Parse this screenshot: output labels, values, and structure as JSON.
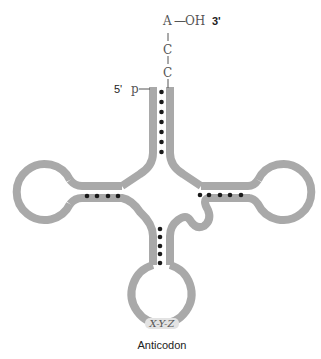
{
  "diagram": {
    "labels": {
      "three_prime_base": "A",
      "three_prime_dash": "—",
      "three_prime_group": "OH",
      "three_prime_end": "3'",
      "c1": "C",
      "c2": "C",
      "five_prime_end": "5'",
      "five_prime_group": "p",
      "anticodon_bases": "X-Y-Z",
      "anticodon_label": "Anticodon"
    },
    "colors": {
      "strand": "#a9a9a9",
      "base_pair_dot": "#1a1a1a",
      "text": "#555555"
    },
    "base_pairs": {
      "acceptor_stem": 7,
      "d_arm": 4,
      "t_arm": 5,
      "anticodon_arm": 5
    }
  }
}
